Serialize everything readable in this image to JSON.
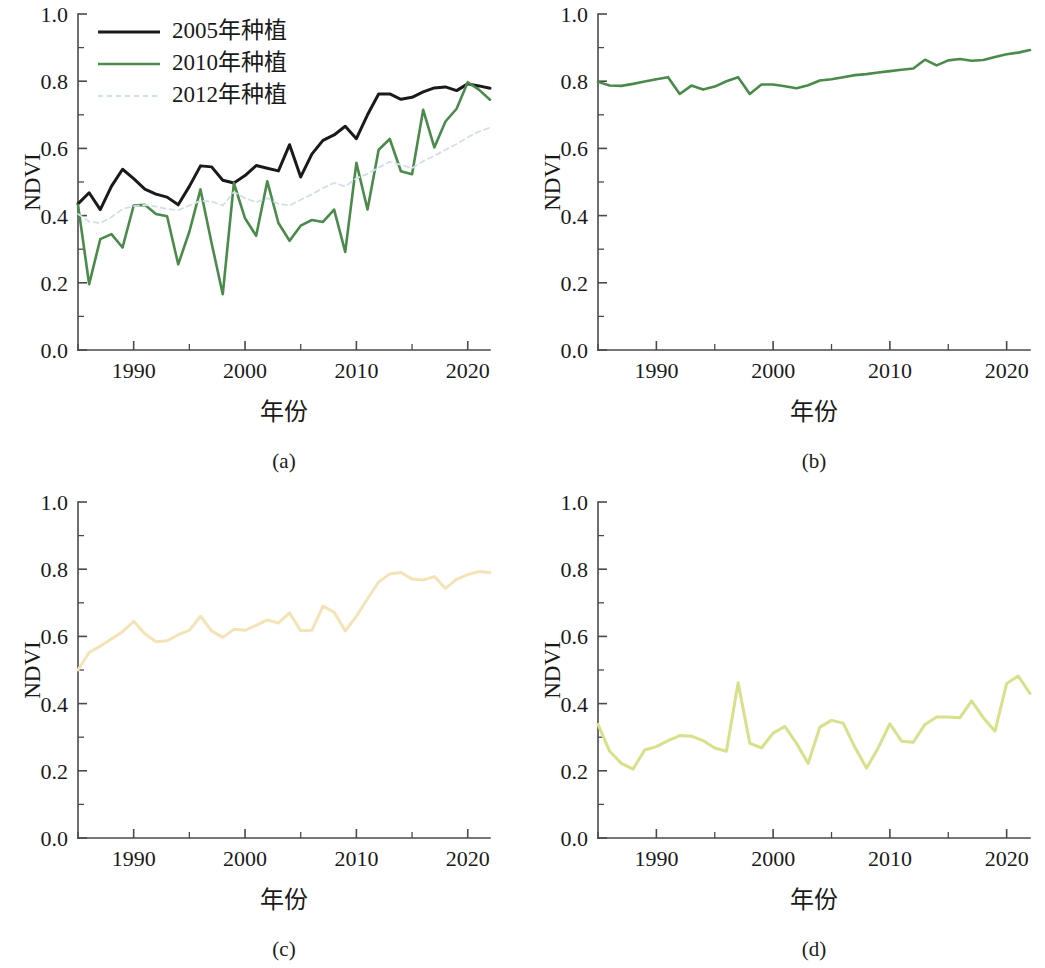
{
  "figure": {
    "background": "#ffffff",
    "axis_color": "#4a4a4a",
    "text_color": "#1a1a1a"
  },
  "axes_common": {
    "ylabel": "NDVI",
    "xlabel": "年份",
    "ylim": [
      0.0,
      1.0
    ],
    "xlim": [
      1985,
      2022
    ],
    "ytick_labels": [
      "0.0",
      "0.2",
      "0.4",
      "0.6",
      "0.8",
      "1.0"
    ],
    "ytick_values": [
      0.0,
      0.2,
      0.4,
      0.6,
      0.8,
      1.0
    ],
    "yminor_values": [
      0.1,
      0.3,
      0.5,
      0.7,
      0.9
    ],
    "xtick_labels": [
      "1990",
      "2000",
      "2010",
      "2020"
    ],
    "xtick_values": [
      1990,
      2000,
      2010,
      2020
    ],
    "xminor_values": [
      1985,
      1995,
      2005,
      2015
    ],
    "grid": false
  },
  "panels": [
    {
      "id": "a",
      "caption": "(a)",
      "has_legend": true
    },
    {
      "id": "b",
      "caption": "(b)",
      "has_legend": false
    },
    {
      "id": "c",
      "caption": "(c)",
      "has_legend": false
    },
    {
      "id": "d",
      "caption": "(d)",
      "has_legend": false
    }
  ],
  "legend": {
    "position": "upper-left",
    "entries": [
      {
        "label": "2005年种植",
        "color": "#1a1a1a",
        "dash": "none",
        "width": 3.0
      },
      {
        "label": "2010年种植",
        "color": "#4a8a4a",
        "dash": "none",
        "width": 2.6
      },
      {
        "label": "2012年种植",
        "color": "#cfe0e8",
        "dash": "dashed",
        "width": 1.8
      }
    ]
  },
  "chart_data": [
    {
      "panel": "a",
      "type": "line",
      "title": "",
      "caption": "(a)",
      "xlabel": "年份",
      "ylabel": "NDVI",
      "xlim": [
        1985,
        2022
      ],
      "ylim": [
        0.0,
        1.0
      ],
      "grid": false,
      "legend_position": "upper-left",
      "x": [
        1985,
        1986,
        1987,
        1988,
        1989,
        1990,
        1991,
        1992,
        1993,
        1994,
        1995,
        1996,
        1997,
        1998,
        1999,
        2000,
        2001,
        2002,
        2003,
        2004,
        2005,
        2006,
        2007,
        2008,
        2009,
        2010,
        2011,
        2012,
        2013,
        2014,
        2015,
        2016,
        2017,
        2018,
        2019,
        2020,
        2021,
        2022
      ],
      "series": [
        {
          "name": "2005年种植",
          "color": "#1a1a1a",
          "dash": "none",
          "width": 3.0,
          "values": [
            0.435,
            0.468,
            0.418,
            0.487,
            0.538,
            0.51,
            0.479,
            0.464,
            0.455,
            0.432,
            0.487,
            0.548,
            0.545,
            0.505,
            0.497,
            0.519,
            0.549,
            0.541,
            0.533,
            0.611,
            0.515,
            0.583,
            0.624,
            0.64,
            0.666,
            0.629,
            0.7,
            0.762,
            0.762,
            0.746,
            0.752,
            0.768,
            0.78,
            0.783,
            0.772,
            0.792,
            0.786,
            0.779
          ]
        },
        {
          "name": "2010年种植",
          "color": "#4a8a4a",
          "dash": "none",
          "width": 2.6,
          "values": [
            0.432,
            0.196,
            0.33,
            0.345,
            0.305,
            0.43,
            0.432,
            0.405,
            0.398,
            0.255,
            0.352,
            0.478,
            0.318,
            0.166,
            0.497,
            0.392,
            0.34,
            0.502,
            0.378,
            0.325,
            0.37,
            0.387,
            0.381,
            0.418,
            0.292,
            0.557,
            0.418,
            0.596,
            0.628,
            0.532,
            0.523,
            0.715,
            0.603,
            0.68,
            0.718,
            0.797,
            0.775,
            0.745
          ]
        },
        {
          "name": "2012年种植",
          "color": "#cfe0e8",
          "dash": "dashed",
          "width": 1.8,
          "values": [
            0.405,
            0.382,
            0.378,
            0.395,
            0.42,
            0.428,
            0.432,
            0.427,
            0.42,
            0.416,
            0.43,
            0.444,
            0.442,
            0.43,
            0.47,
            0.452,
            0.44,
            0.452,
            0.435,
            0.43,
            0.447,
            0.463,
            0.482,
            0.497,
            0.487,
            0.511,
            0.524,
            0.543,
            0.56,
            0.551,
            0.541,
            0.562,
            0.578,
            0.596,
            0.613,
            0.633,
            0.65,
            0.662
          ]
        }
      ]
    },
    {
      "panel": "b",
      "type": "line",
      "title": "",
      "caption": "(b)",
      "xlabel": "年份",
      "ylabel": "NDVI",
      "xlim": [
        1985,
        2022
      ],
      "ylim": [
        0.0,
        1.0
      ],
      "grid": false,
      "x": [
        1985,
        1986,
        1987,
        1988,
        1989,
        1990,
        1991,
        1992,
        1993,
        1994,
        1995,
        1996,
        1997,
        1998,
        1999,
        2000,
        2001,
        2002,
        2003,
        2004,
        2005,
        2006,
        2007,
        2008,
        2009,
        2010,
        2011,
        2012,
        2013,
        2014,
        2015,
        2016,
        2017,
        2018,
        2019,
        2020,
        2021,
        2022
      ],
      "series": [
        {
          "name": "NDVI",
          "color": "#4a8a4a",
          "dash": "none",
          "width": 2.6,
          "values": [
            0.798,
            0.787,
            0.786,
            0.792,
            0.799,
            0.806,
            0.812,
            0.762,
            0.787,
            0.775,
            0.784,
            0.8,
            0.812,
            0.762,
            0.79,
            0.79,
            0.785,
            0.779,
            0.788,
            0.802,
            0.806,
            0.812,
            0.818,
            0.821,
            0.826,
            0.83,
            0.834,
            0.838,
            0.864,
            0.847,
            0.862,
            0.866,
            0.861,
            0.863,
            0.872,
            0.88,
            0.885,
            0.893
          ]
        }
      ]
    },
    {
      "panel": "c",
      "type": "line",
      "title": "",
      "caption": "(c)",
      "xlabel": "年份",
      "ylabel": "NDVI",
      "xlim": [
        1985,
        2022
      ],
      "ylim": [
        0.0,
        1.0
      ],
      "grid": false,
      "x": [
        1985,
        1986,
        1987,
        1988,
        1989,
        1990,
        1991,
        1992,
        1993,
        1994,
        1995,
        1996,
        1997,
        1998,
        1999,
        2000,
        2001,
        2002,
        2003,
        2004,
        2005,
        2006,
        2007,
        2008,
        2009,
        2010,
        2011,
        2012,
        2013,
        2014,
        2015,
        2016,
        2017,
        2018,
        2019,
        2020,
        2021,
        2022
      ],
      "series": [
        {
          "name": "NDVI",
          "color": "#f5e3b8",
          "dash": "none",
          "width": 3.0,
          "values": [
            0.5,
            0.552,
            0.571,
            0.592,
            0.614,
            0.645,
            0.608,
            0.584,
            0.587,
            0.605,
            0.618,
            0.66,
            0.616,
            0.597,
            0.621,
            0.618,
            0.633,
            0.649,
            0.64,
            0.67,
            0.617,
            0.618,
            0.69,
            0.672,
            0.616,
            0.66,
            0.712,
            0.762,
            0.786,
            0.79,
            0.771,
            0.768,
            0.778,
            0.743,
            0.77,
            0.784,
            0.793,
            0.79
          ]
        }
      ]
    },
    {
      "panel": "d",
      "type": "line",
      "title": "",
      "caption": "(d)",
      "xlabel": "年份",
      "ylabel": "NDVI",
      "xlim": [
        1985,
        2022
      ],
      "ylim": [
        0.0,
        1.0
      ],
      "grid": false,
      "x": [
        1985,
        1986,
        1987,
        1988,
        1989,
        1990,
        1991,
        1992,
        1993,
        1994,
        1995,
        1996,
        1997,
        1998,
        1999,
        2000,
        2001,
        2002,
        2003,
        2004,
        2005,
        2006,
        2007,
        2008,
        2009,
        2010,
        2011,
        2012,
        2013,
        2014,
        2015,
        2016,
        2017,
        2018,
        2019,
        2020,
        2021,
        2022
      ],
      "series": [
        {
          "name": "NDVI",
          "color": "#d8e08a",
          "dash": "none",
          "width": 3.0,
          "values": [
            0.338,
            0.258,
            0.222,
            0.205,
            0.262,
            0.272,
            0.29,
            0.305,
            0.303,
            0.29,
            0.268,
            0.258,
            0.462,
            0.282,
            0.268,
            0.312,
            0.332,
            0.282,
            0.222,
            0.33,
            0.35,
            0.342,
            0.27,
            0.208,
            0.268,
            0.34,
            0.288,
            0.285,
            0.338,
            0.36,
            0.36,
            0.358,
            0.408,
            0.358,
            0.318,
            0.46,
            0.482,
            0.43
          ]
        }
      ]
    }
  ]
}
